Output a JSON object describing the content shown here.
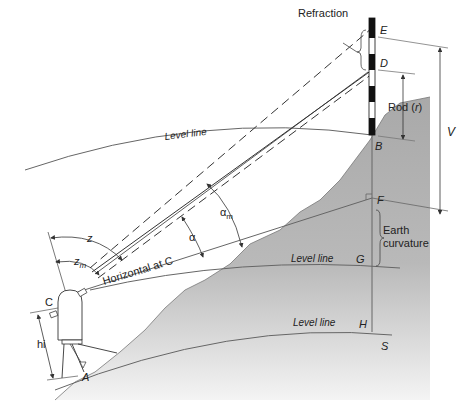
{
  "figure": {
    "colors": {
      "terrain": "#a9a9a9",
      "terrain_fade": "#f2f2f2",
      "line": "#555555",
      "rod_black": "#111111",
      "rod_white": "#ffffff"
    }
  },
  "labels": {
    "refraction": "Refraction",
    "point_e": "E",
    "point_d": "D",
    "rod": "Rod (",
    "rod_r": "r",
    "rod_close": ")",
    "v": "V",
    "point_b": "B",
    "level_line_top": "Level line",
    "point_f": "F",
    "earth": "Earth",
    "curvature": "curvature",
    "level_line_mid": "Level line",
    "point_g": "G",
    "level_line_bottom": "Level line",
    "point_h": "H",
    "point_s": "S",
    "z": "z",
    "zm": "z",
    "zm_sub": "m",
    "alpha": "α",
    "alpha_m": "α",
    "alpha_m_sub": "m",
    "horizontal_at_c": "Horizontal at C",
    "point_c": "C",
    "hi": "hi",
    "point_a": "A"
  }
}
